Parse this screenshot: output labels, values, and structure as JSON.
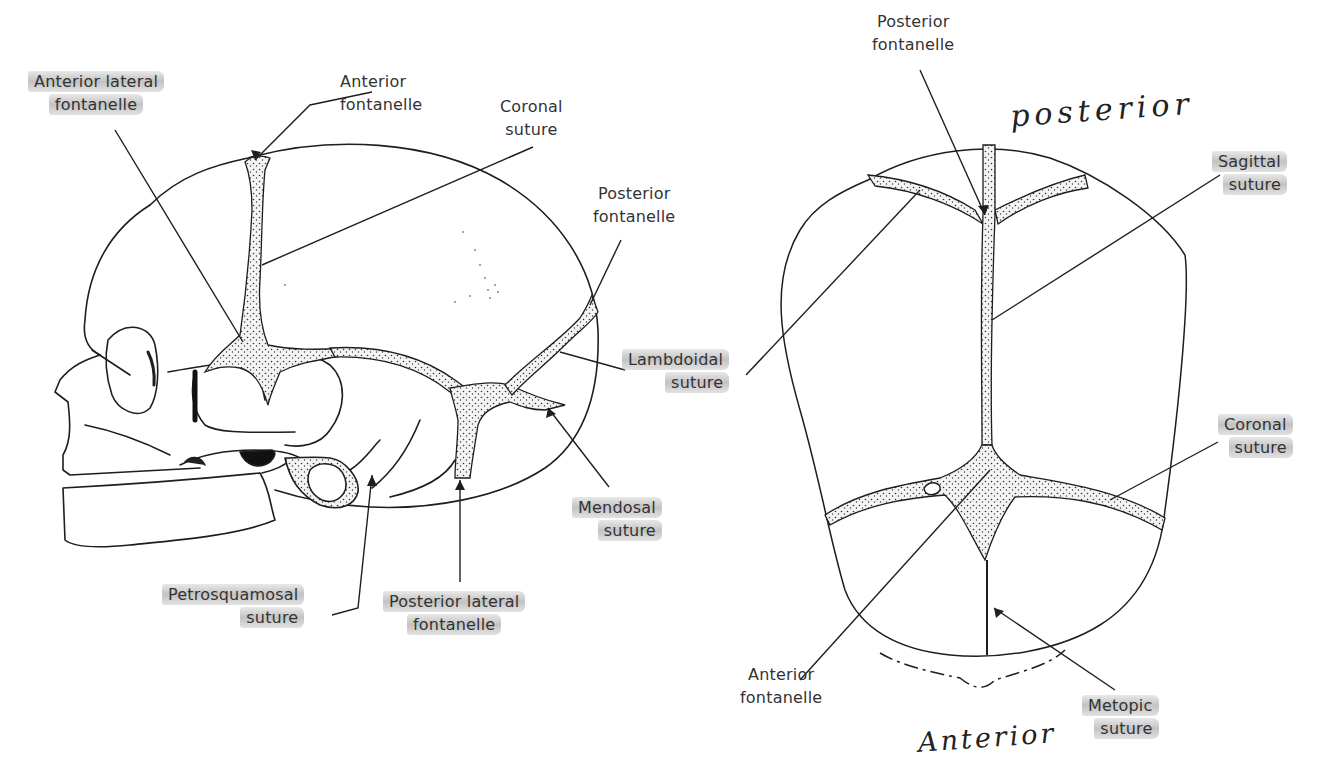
{
  "figure": {
    "lateral_view": {
      "labels": {
        "anterior_lateral_fontanelle": [
          "Anterior lateral",
          "fontanelle"
        ],
        "anterior_fontanelle": [
          "Anterior",
          "fontanelle"
        ],
        "coronal_suture": [
          "Coronal",
          "suture"
        ],
        "posterior_fontanelle": [
          "Posterior",
          "fontanelle"
        ],
        "lambdoidal_suture": [
          "Lambdoidal",
          "suture"
        ],
        "mendosal_suture": [
          "Mendosal",
          "suture"
        ],
        "petrosquamosal_suture": [
          "Petrosquamosal",
          "suture"
        ],
        "posterior_lateral_fontanelle": [
          "Posterior lateral",
          "fontanelle"
        ]
      }
    },
    "superior_view": {
      "labels": {
        "posterior_fontanelle": [
          "Posterior",
          "fontanelle"
        ],
        "sagittal_suture": [
          "Sagittal",
          "suture"
        ],
        "lambdoidal_suture_pointer": "Lambdoidal suture",
        "coronal_suture": [
          "Coronal",
          "suture"
        ],
        "anterior_fontanelle": [
          "Anterior",
          "fontanelle"
        ],
        "metopic_suture": [
          "Metopic",
          "suture"
        ]
      },
      "handwritten": {
        "top": "posterior",
        "bottom": "Anterior"
      }
    },
    "colors": {
      "line": "#1e1e1e",
      "highlight": "#b4b4b4",
      "text": "#333333",
      "background": "#ffffff"
    }
  }
}
